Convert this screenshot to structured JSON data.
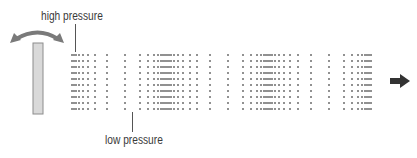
{
  "diagram": {
    "labels": {
      "high": "high pressure",
      "low": "low pressure"
    },
    "colors": {
      "dots": "#555555",
      "rod_fill": "#d9d9d9",
      "rod_stroke": "#8c8c8c",
      "swing_arrow": "#7a7a7a",
      "flow_arrow": "#333333",
      "text": "#3a3a3a"
    },
    "icons": {
      "swing": "curved-double-arrow-icon",
      "flow": "right-arrow-icon",
      "source": "vibrating-rod"
    },
    "columns_x": [
      72,
      74,
      76,
      79,
      83,
      88,
      95,
      107,
      125,
      140,
      148,
      154,
      158,
      161,
      163,
      165,
      167,
      169,
      171,
      174,
      178,
      183,
      190,
      197,
      210,
      228,
      243,
      251,
      257,
      261,
      264,
      266,
      268,
      270,
      272,
      275,
      279,
      284,
      290,
      298,
      311,
      329,
      344,
      352,
      358,
      362,
      365,
      367,
      369,
      371
    ],
    "rows_y": [
      55,
      61,
      67,
      73,
      79,
      85,
      91,
      97,
      103,
      109
    ]
  }
}
